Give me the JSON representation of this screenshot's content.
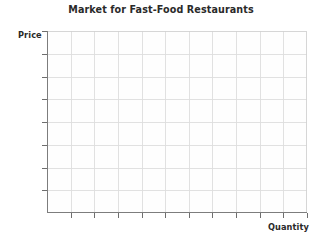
{
  "chart_data": {
    "type": "line",
    "title": "Market for Fast-Food Restaurants",
    "xlabel": "Quantity",
    "ylabel": "Price",
    "series": [],
    "categories": [],
    "values": [],
    "annotations": [],
    "legend": null,
    "legend_position": "none",
    "grid": true,
    "grid_columns": 11,
    "grid_rows": 8,
    "xlim": [
      0,
      11
    ],
    "ylim": [
      0,
      8
    ],
    "x_tick_labels": [],
    "y_tick_labels": []
  },
  "colors": {
    "background": "#ffffff",
    "plot_background": "#fefefe",
    "grid_line": "#dedede",
    "axis_line": "#7d7d7d",
    "tick_mark": "#6e6e6e",
    "title_text": "#2a2a2a",
    "label_text": "#2a2a2a"
  }
}
